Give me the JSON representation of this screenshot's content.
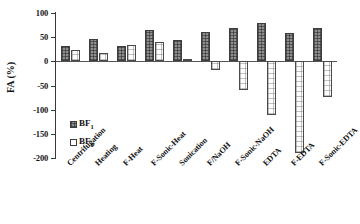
{
  "chart_data": {
    "type": "bar",
    "title": "",
    "xlabel": "",
    "ylabel": "FA (%)",
    "ylim": [
      -200,
      100
    ],
    "yticks": [
      100,
      50,
      0,
      -50,
      -100,
      -150,
      -200
    ],
    "ytick_labels": [
      "100",
      "50",
      "0",
      "-50",
      "-100",
      "-150",
      "-200"
    ],
    "grid": false,
    "legend_position": "inside-left-lower",
    "categories": [
      "Centrifugation",
      "Heating",
      "F-Heat",
      "F-Sonic-Heat",
      "Sonication",
      "F/NaOH",
      "F-Sonic-NaOH",
      "EDTA",
      "F-EDTA",
      "F-Sonic-EDTA"
    ],
    "series": [
      {
        "name": "BF1",
        "legend_label": "BF",
        "legend_subscript": "1",
        "fill": "dark-hatched",
        "values": [
          32,
          47,
          32,
          64,
          45,
          60,
          68,
          80,
          58,
          70
        ]
      },
      {
        "name": "BF0",
        "legend_label": "BF",
        "legend_subscript": "0",
        "fill": "white-dotted",
        "values": [
          23,
          18,
          33,
          39,
          5,
          -17,
          -59,
          -111,
          -190,
          -74
        ]
      }
    ]
  },
  "colors": {
    "axis": "#3a3a3a",
    "baseline": "#555555",
    "series_bf1": "#8e8e8e",
    "series_bf0": "#fdfdfd",
    "text": "#141414",
    "background": "#ffffff"
  }
}
